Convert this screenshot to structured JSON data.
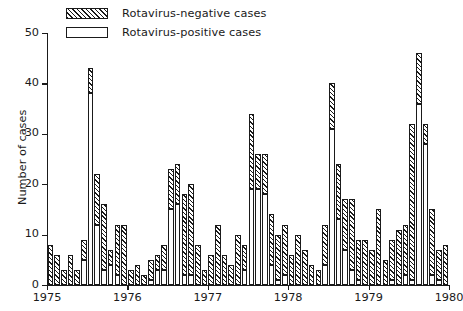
{
  "legend": {
    "position": "top-left",
    "items": [
      {
        "label": "Rotavirus-negative cases",
        "pattern": "hatched",
        "color": "#1a1a1a"
      },
      {
        "label": "Rotavirus-positive cases",
        "pattern": "solid-white",
        "color": "#ffffff"
      }
    ]
  },
  "axes": {
    "ylabel": "Number of cases",
    "yticks": [
      "0",
      "10",
      "20",
      "30",
      "40",
      "50"
    ],
    "xticklabels": [
      "1975",
      "1976",
      "1977",
      "1978",
      "1979",
      "1980"
    ]
  },
  "chart_data": {
    "type": "bar",
    "title": "",
    "xlabel": "",
    "ylabel": "Number of cases",
    "ylim": [
      0,
      50
    ],
    "xlim": [
      0,
      60
    ],
    "grid": false,
    "stacked": true,
    "legend_position": "top-left",
    "categories": [
      "1975-01",
      "1975-02",
      "1975-03",
      "1975-04",
      "1975-05",
      "1975-06",
      "1975-07",
      "1975-08",
      "1975-09",
      "1975-10",
      "1975-11",
      "1975-12",
      "1976-01",
      "1976-02",
      "1976-03",
      "1976-04",
      "1976-05",
      "1976-06",
      "1976-07",
      "1976-08",
      "1976-09",
      "1976-10",
      "1976-11",
      "1976-12",
      "1977-01",
      "1977-02",
      "1977-03",
      "1977-04",
      "1977-05",
      "1977-06",
      "1977-07",
      "1977-08",
      "1977-09",
      "1977-10",
      "1977-11",
      "1977-12",
      "1978-01",
      "1978-02",
      "1978-03",
      "1978-04",
      "1978-05",
      "1978-06",
      "1978-07",
      "1978-08",
      "1978-09",
      "1978-10",
      "1978-11",
      "1978-12",
      "1979-01",
      "1979-02",
      "1979-03",
      "1979-04",
      "1979-05",
      "1979-06",
      "1979-07",
      "1979-08",
      "1979-09",
      "1979-10",
      "1979-11",
      "1979-12"
    ],
    "xticks_at": [
      0,
      12,
      24,
      36,
      48,
      60
    ],
    "series": [
      {
        "name": "Rotavirus-positive cases",
        "pattern": "solid-white",
        "values": [
          0,
          0,
          0,
          0,
          0,
          5,
          38,
          12,
          3,
          4,
          2,
          0,
          0,
          0,
          0,
          1,
          3,
          3,
          15,
          16,
          2,
          2,
          0,
          0,
          0,
          0,
          0,
          0,
          0,
          3,
          19,
          19,
          18,
          4,
          1,
          2,
          0,
          0,
          0,
          0,
          0,
          4,
          31,
          13,
          7,
          3,
          1,
          0,
          0,
          0,
          0,
          1,
          0,
          2,
          1,
          36,
          28,
          2,
          1,
          0
        ]
      },
      {
        "name": "Rotavirus-negative cases",
        "pattern": "hatched",
        "values": [
          8,
          6,
          3,
          6,
          3,
          4,
          5,
          10,
          13,
          3,
          10,
          12,
          3,
          4,
          2,
          4,
          3,
          5,
          8,
          8,
          16,
          18,
          8,
          3,
          6,
          12,
          6,
          4,
          10,
          5,
          15,
          7,
          8,
          10,
          9,
          10,
          6,
          10,
          7,
          4,
          3,
          8,
          9,
          11,
          10,
          14,
          8,
          9,
          7,
          15,
          5,
          8,
          11,
          10,
          31,
          10,
          4,
          13,
          6,
          8
        ]
      }
    ],
    "totals": [
      8,
      6,
      3,
      6,
      3,
      9,
      43,
      22,
      16,
      7,
      12,
      12,
      3,
      4,
      2,
      5,
      6,
      8,
      23,
      24,
      18,
      20,
      8,
      3,
      6,
      12,
      6,
      4,
      10,
      8,
      34,
      26,
      26,
      14,
      10,
      12,
      6,
      10,
      7,
      4,
      3,
      12,
      40,
      24,
      17,
      17,
      9,
      9,
      7,
      15,
      5,
      9,
      11,
      12,
      32,
      46,
      32,
      15,
      7,
      8
    ]
  }
}
